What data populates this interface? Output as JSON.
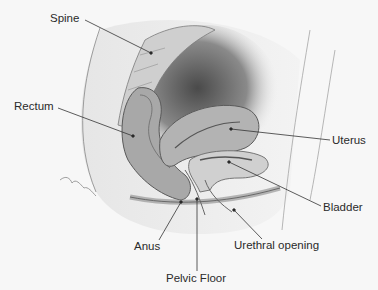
{
  "diagram": {
    "type": "anatomical-cross-section",
    "labels": [
      {
        "id": "spine",
        "text": "Spine",
        "x": 50,
        "y": 13
      },
      {
        "id": "rectum",
        "text": "Rectum",
        "x": 14,
        "y": 101
      },
      {
        "id": "uterus",
        "text": "Uterus",
        "x": 332,
        "y": 135
      },
      {
        "id": "bladder",
        "text": "Bladder",
        "x": 323,
        "y": 202
      },
      {
        "id": "anus",
        "text": "Anus",
        "x": 134,
        "y": 241
      },
      {
        "id": "urethral_opening",
        "text": "Urethral opening",
        "x": 234,
        "y": 240
      },
      {
        "id": "pelvic_floor",
        "text": "Pelvic Floor",
        "x": 166,
        "y": 273
      }
    ],
    "leaders": [
      {
        "id": "spine",
        "x1": 85,
        "y1": 20,
        "x2": 151,
        "y2": 53
      },
      {
        "id": "rectum",
        "x1": 58,
        "y1": 108,
        "x2": 133,
        "y2": 136
      },
      {
        "id": "uterus",
        "x1": 231,
        "y1": 129,
        "x2": 330,
        "y2": 140
      },
      {
        "id": "bladder",
        "x1": 229,
        "y1": 162,
        "x2": 321,
        "y2": 206
      },
      {
        "id": "anus",
        "x1": 181,
        "y1": 202,
        "x2": 159,
        "y2": 240
      },
      {
        "id": "pelvic_floor",
        "x1": 197,
        "y1": 199,
        "x2": 197,
        "y2": 271
      },
      {
        "id": "urethral_opening",
        "x1": 234,
        "y1": 210,
        "x2": 262,
        "y2": 239
      }
    ],
    "colors": {
      "background": "#f7f7f7",
      "tissue_light": "#d9d9d9",
      "tissue_mid": "#a8a8a8",
      "tissue_dark": "#5a5a5a",
      "line": "#333333",
      "text": "#2a2a2a"
    }
  }
}
